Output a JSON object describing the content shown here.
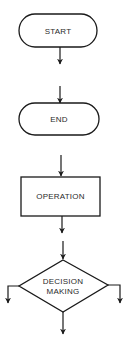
{
  "diagram": {
    "type": "flowchart-symbol-legend",
    "background": "#ffffff",
    "stroke_color": "#1a1a1a",
    "nodes": [
      {
        "id": "start",
        "shape": "terminal",
        "label": "START"
      },
      {
        "id": "end",
        "shape": "terminal",
        "label": "END"
      },
      {
        "id": "operation",
        "shape": "process",
        "label": "OPERATION"
      },
      {
        "id": "decision",
        "shape": "decision",
        "label_line1": "DECISION",
        "label_line2": "MAKING"
      }
    ],
    "arrows": [
      {
        "from": "start",
        "direction": "down"
      },
      {
        "to": "end",
        "direction": "down"
      },
      {
        "from": "end",
        "direction": "down"
      },
      {
        "to": "operation",
        "direction": "down"
      },
      {
        "from": "operation",
        "direction": "down"
      },
      {
        "to": "decision",
        "direction": "down"
      },
      {
        "from": "decision",
        "side": "left",
        "direction": "down"
      },
      {
        "from": "decision",
        "side": "right",
        "direction": "down"
      },
      {
        "from": "decision",
        "side": "bottom",
        "direction": "down"
      }
    ]
  }
}
